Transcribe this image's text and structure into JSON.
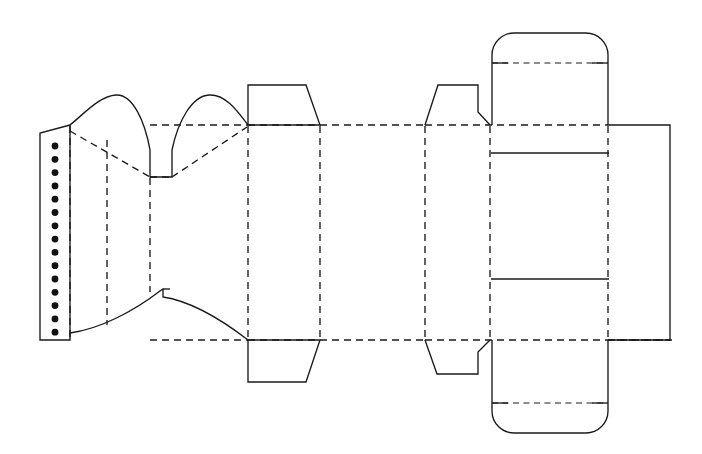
{
  "document": {
    "title": "Carton Dieline Template",
    "type": "packaging-dieline",
    "canvas": {
      "width": 702,
      "height": 454,
      "background": "#ffffff"
    }
  },
  "legend": {
    "cut_line_label": "Cut line",
    "crease_line_label": "Crease / fold line",
    "glue_dot_label": "Glue point",
    "cut_color": "#1a1a1a",
    "crease_color": "#1a1a1a",
    "glue_color": "#111111"
  },
  "structure": {
    "glue_flap": {
      "name": "Glue flap",
      "left_x": 40,
      "right_x": 70,
      "top_y": 133,
      "bottom_y": 340,
      "glue_dot_count": 15,
      "glue_dot_radius": 3.4,
      "glue_dot_x": 55,
      "glue_dot_first_y": 146,
      "glue_dot_spacing": 13.3
    },
    "fold_lines_vertical_x": [
      70,
      107,
      150,
      248,
      320,
      425,
      490,
      608
    ],
    "body_top_y": 125,
    "body_bottom_y": 340,
    "panels": [
      {
        "name": "glue-flap-panel",
        "x1": 40,
        "x2": 70
      },
      {
        "name": "left-side-panel",
        "x1": 70,
        "x2": 150
      },
      {
        "name": "left-gusset-panel",
        "x1": 150,
        "x2": 248
      },
      {
        "name": "front-panel",
        "x1": 248,
        "x2": 425
      },
      {
        "name": "right-side-panel",
        "x1": 425,
        "x2": 490
      },
      {
        "name": "back-panel",
        "x1": 490,
        "x2": 608
      },
      {
        "name": "end-flap-panel",
        "x1": 608,
        "x2": 670
      }
    ],
    "top_dust_flaps": [
      {
        "name": "top-dust-flap-left",
        "left_x": 248,
        "right_x": 320,
        "top_y": 85,
        "inset": 14
      },
      {
        "name": "top-dust-flap-right",
        "left_x": 425,
        "right_x": 490,
        "top_y": 85,
        "inset": 13
      }
    ],
    "bottom_dust_flaps": [
      {
        "name": "bottom-dust-flap-left",
        "left_x": 248,
        "right_x": 320,
        "bottom_y": 382,
        "inset": 14
      },
      {
        "name": "bottom-dust-flap-right",
        "left_x": 425,
        "right_x": 490,
        "bottom_y": 374,
        "inset": 13
      }
    ],
    "top_tuck_flap": {
      "name": "top-tuck-flap",
      "left_x": 492,
      "right_x": 608,
      "top_y": 32,
      "base_y": 125,
      "crease_y": 63,
      "corner_radius": 22
    },
    "bottom_tuck_flap": {
      "name": "bottom-tuck-flap",
      "left_x": 492,
      "right_x": 608,
      "bottom_y": 433,
      "base_y": 340,
      "crease_y": 403,
      "corner_radius": 22
    },
    "inner_window": {
      "name": "back-panel-window",
      "x1": 491,
      "x2": 609,
      "y1": 153,
      "y2": 279
    },
    "top_curved_wings": {
      "name": "top-curved-gusset-wings",
      "left_anchor_x": 70,
      "right_anchor_x": 248,
      "notch_left_x": 150,
      "notch_right_x": 172,
      "notch_y": 177,
      "peak_y": 95
    },
    "bottom_curved_wings": {
      "name": "bottom-curved-gusset-wings",
      "left_anchor_x": 70,
      "right_anchor_x": 248,
      "notch_x": 163,
      "notch_y": 290,
      "arc_depth_y": 330
    },
    "diagonal_creases": [
      {
        "name": "diagonal-crease-top-left",
        "x1": 70,
        "y1": 133,
        "x2": 150,
        "y2": 177
      },
      {
        "name": "diagonal-crease-top-right",
        "x1": 172,
        "y1": 177,
        "x2": 248,
        "y2": 128
      }
    ]
  }
}
